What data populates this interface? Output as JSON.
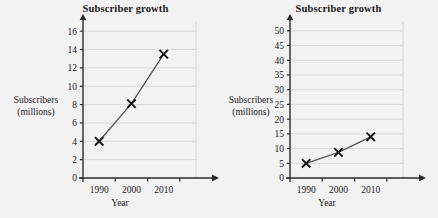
{
  "chart_data": [
    {
      "type": "line",
      "panel": "left",
      "title": "Subscriber growth",
      "xlabel": "Year",
      "ylabel_line1": "Subscribers",
      "ylabel_line2": "(millions)",
      "categories": [
        "1990",
        "2000",
        "2010"
      ],
      "x": [
        1990,
        2000,
        2010
      ],
      "values": [
        4,
        8.1,
        13.5
      ],
      "xlim": [
        1985,
        2020
      ],
      "ylim": [
        0,
        17
      ],
      "yticks": [
        0,
        2,
        4,
        6,
        8,
        10,
        12,
        14,
        16
      ],
      "xticks": [
        "1990",
        "2000",
        "2010"
      ],
      "grid": "horizontal",
      "legend": "none",
      "marker": "x",
      "line_color": "#555555",
      "marker_color": "#111111",
      "grid_color": "#d2d2d2",
      "axis_color": "#2b2b2b"
    },
    {
      "type": "line",
      "panel": "right",
      "title": "Subscriber growth",
      "xlabel": "Year",
      "ylabel_line1": "Subscribers",
      "ylabel_line2": "(millions)",
      "categories": [
        "1990",
        "2000",
        "2010"
      ],
      "x": [
        1990,
        2000,
        2010
      ],
      "values": [
        5,
        8.7,
        14
      ],
      "xlim": [
        1985,
        2020
      ],
      "ylim": [
        0,
        53
      ],
      "yticks": [
        0,
        5,
        10,
        15,
        20,
        25,
        30,
        35,
        40,
        45,
        50
      ],
      "xticks": [
        "1990",
        "2000",
        "2010"
      ],
      "grid": "horizontal",
      "legend": "none",
      "marker": "x",
      "line_color": "#555555",
      "marker_color": "#111111",
      "grid_color": "#d2d2d2",
      "axis_color": "#2b2b2b"
    }
  ],
  "figure": {
    "background": "#f2f2f2",
    "panel_count": 2
  }
}
